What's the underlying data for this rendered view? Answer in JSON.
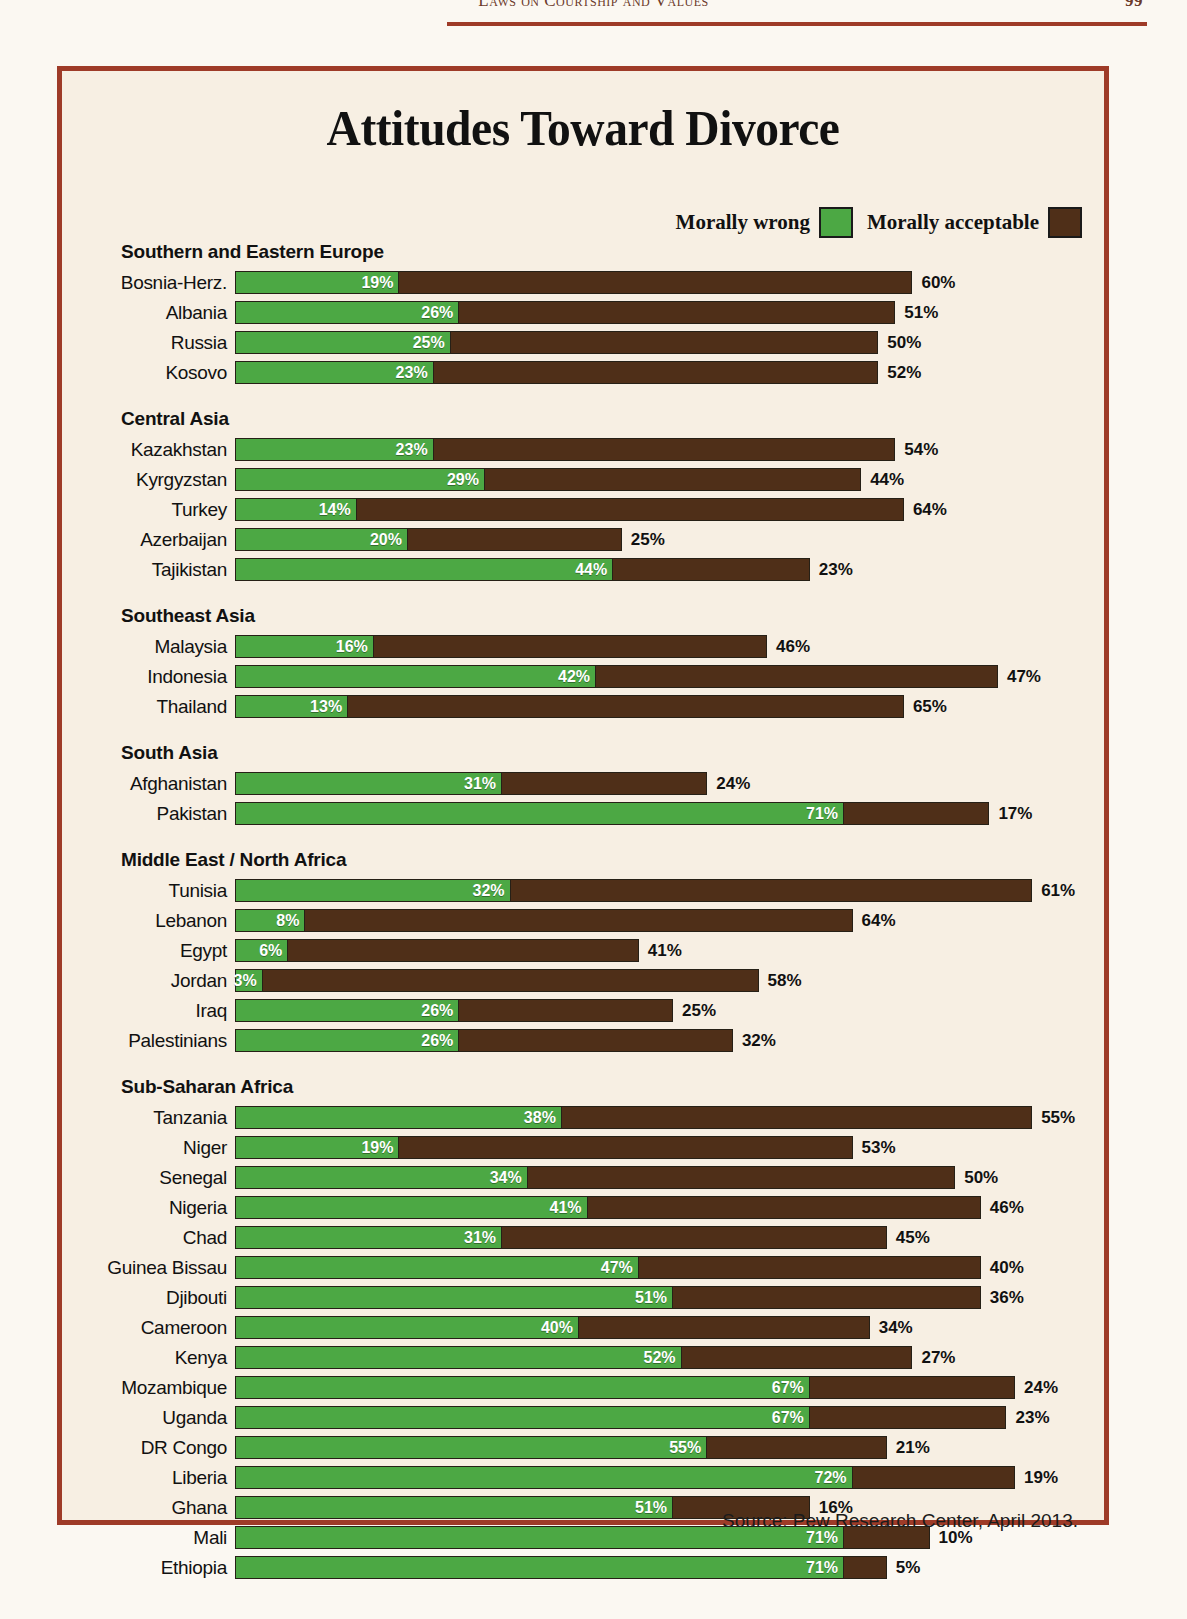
{
  "page": {
    "running_head": "Laws on Courtship and Values",
    "page_number": "99"
  },
  "figure": {
    "title": "Attitudes Toward Divorce",
    "source": "Source: Pew Research Center, April 2013.",
    "legend": [
      {
        "label": "Morally wrong",
        "color": "#4ca844",
        "icon": "green-swatch"
      },
      {
        "label": "Morally acceptable",
        "color": "#4f2f18",
        "icon": "brown-swatch"
      }
    ]
  },
  "chart_data": {
    "type": "bar",
    "orientation": "horizontal",
    "stacked": true,
    "title": "Attitudes Toward Divorce",
    "xlabel": "",
    "ylabel": "",
    "unit": "%",
    "legend_position": "top-right",
    "grid": false,
    "series": [
      {
        "name": "Morally wrong",
        "color": "#4ca844"
      },
      {
        "name": "Morally acceptable",
        "color": "#4f2f18"
      }
    ],
    "groups": [
      {
        "name": "Southern and Eastern Europe",
        "rows": [
          {
            "label": "Bosnia-Herz.",
            "wrong": 19,
            "acceptable": 60,
            "wrong_text": "19%",
            "acceptable_text": "60%"
          },
          {
            "label": "Albania",
            "wrong": 26,
            "acceptable": 51,
            "wrong_text": "26%",
            "acceptable_text": "51%"
          },
          {
            "label": "Russia",
            "wrong": 25,
            "acceptable": 50,
            "wrong_text": "25%",
            "acceptable_text": "50%"
          },
          {
            "label": "Kosovo",
            "wrong": 23,
            "acceptable": 52,
            "wrong_text": "23%",
            "acceptable_text": "52%"
          }
        ]
      },
      {
        "name": "Central Asia",
        "rows": [
          {
            "label": "Kazakhstan",
            "wrong": 23,
            "acceptable": 54,
            "wrong_text": "23%",
            "acceptable_text": "54%"
          },
          {
            "label": "Kyrgyzstan",
            "wrong": 29,
            "acceptable": 44,
            "wrong_text": "29%",
            "acceptable_text": "44%"
          },
          {
            "label": "Turkey",
            "wrong": 14,
            "acceptable": 64,
            "wrong_text": "14%",
            "acceptable_text": "64%"
          },
          {
            "label": "Azerbaijan",
            "wrong": 20,
            "acceptable": 25,
            "wrong_text": "20%",
            "acceptable_text": "25%"
          },
          {
            "label": "Tajikistan",
            "wrong": 44,
            "acceptable": 23,
            "wrong_text": "44%",
            "acceptable_text": "23%"
          }
        ]
      },
      {
        "name": "Southeast Asia",
        "rows": [
          {
            "label": "Malaysia",
            "wrong": 16,
            "acceptable": 46,
            "wrong_text": "16%",
            "acceptable_text": "46%"
          },
          {
            "label": "Indonesia",
            "wrong": 42,
            "acceptable": 47,
            "wrong_text": "42%",
            "acceptable_text": "47%"
          },
          {
            "label": "Thailand",
            "wrong": 13,
            "acceptable": 65,
            "wrong_text": "13%",
            "acceptable_text": "65%"
          }
        ]
      },
      {
        "name": "South Asia",
        "rows": [
          {
            "label": "Afghanistan",
            "wrong": 31,
            "acceptable": 24,
            "wrong_text": "31%",
            "acceptable_text": "24%"
          },
          {
            "label": "Pakistan",
            "wrong": 71,
            "acceptable": 17,
            "wrong_text": "71%",
            "acceptable_text": "17%"
          }
        ]
      },
      {
        "name": "Middle East / North Africa",
        "rows": [
          {
            "label": "Tunisia",
            "wrong": 32,
            "acceptable": 61,
            "wrong_text": "32%",
            "acceptable_text": "61%"
          },
          {
            "label": "Lebanon",
            "wrong": 8,
            "acceptable": 64,
            "wrong_text": "8%",
            "acceptable_text": "64%"
          },
          {
            "label": "Egypt",
            "wrong": 6,
            "acceptable": 41,
            "wrong_text": "6%",
            "acceptable_text": "41%"
          },
          {
            "label": "Jordan",
            "wrong": 3,
            "acceptable": 58,
            "wrong_text": "3%",
            "acceptable_text": "58%"
          },
          {
            "label": "Iraq",
            "wrong": 26,
            "acceptable": 25,
            "wrong_text": "26%",
            "acceptable_text": "25%"
          },
          {
            "label": "Palestinians",
            "wrong": 26,
            "acceptable": 32,
            "wrong_text": "26%",
            "acceptable_text": "32%"
          }
        ]
      },
      {
        "name": "Sub-Saharan Africa",
        "rows": [
          {
            "label": "Tanzania",
            "wrong": 38,
            "acceptable": 55,
            "wrong_text": "38%",
            "acceptable_text": "55%"
          },
          {
            "label": "Niger",
            "wrong": 19,
            "acceptable": 53,
            "wrong_text": "19%",
            "acceptable_text": "53%"
          },
          {
            "label": "Senegal",
            "wrong": 34,
            "acceptable": 50,
            "wrong_text": "34%",
            "acceptable_text": "50%"
          },
          {
            "label": "Nigeria",
            "wrong": 41,
            "acceptable": 46,
            "wrong_text": "41%",
            "acceptable_text": "46%"
          },
          {
            "label": "Chad",
            "wrong": 31,
            "acceptable": 45,
            "wrong_text": "31%",
            "acceptable_text": "45%"
          },
          {
            "label": "Guinea Bissau",
            "wrong": 47,
            "acceptable": 40,
            "wrong_text": "47%",
            "acceptable_text": "40%"
          },
          {
            "label": "Djibouti",
            "wrong": 51,
            "acceptable": 36,
            "wrong_text": "51%",
            "acceptable_text": "36%"
          },
          {
            "label": "Cameroon",
            "wrong": 40,
            "acceptable": 34,
            "wrong_text": "40%",
            "acceptable_text": "34%"
          },
          {
            "label": "Kenya",
            "wrong": 52,
            "acceptable": 27,
            "wrong_text": "52%",
            "acceptable_text": "27%"
          },
          {
            "label": "Mozambique",
            "wrong": 67,
            "acceptable": 24,
            "wrong_text": "67%",
            "acceptable_text": "24%"
          },
          {
            "label": "Uganda",
            "wrong": 67,
            "acceptable": 23,
            "wrong_text": "67%",
            "acceptable_text": "23%"
          },
          {
            "label": "DR Congo",
            "wrong": 55,
            "acceptable": 21,
            "wrong_text": "55%",
            "acceptable_text": "21%"
          },
          {
            "label": "Liberia",
            "wrong": 72,
            "acceptable": 19,
            "wrong_text": "72%",
            "acceptable_text": "19%"
          },
          {
            "label": "Ghana",
            "wrong": 51,
            "acceptable": 16,
            "wrong_text": "51%",
            "acceptable_text": "16%"
          },
          {
            "label": "Mali",
            "wrong": 71,
            "acceptable": 10,
            "wrong_text": "71%",
            "acceptable_text": "10%"
          },
          {
            "label": "Ethiopia",
            "wrong": 71,
            "acceptable": 5,
            "wrong_text": "71%",
            "acceptable_text": "5%"
          }
        ]
      }
    ]
  }
}
